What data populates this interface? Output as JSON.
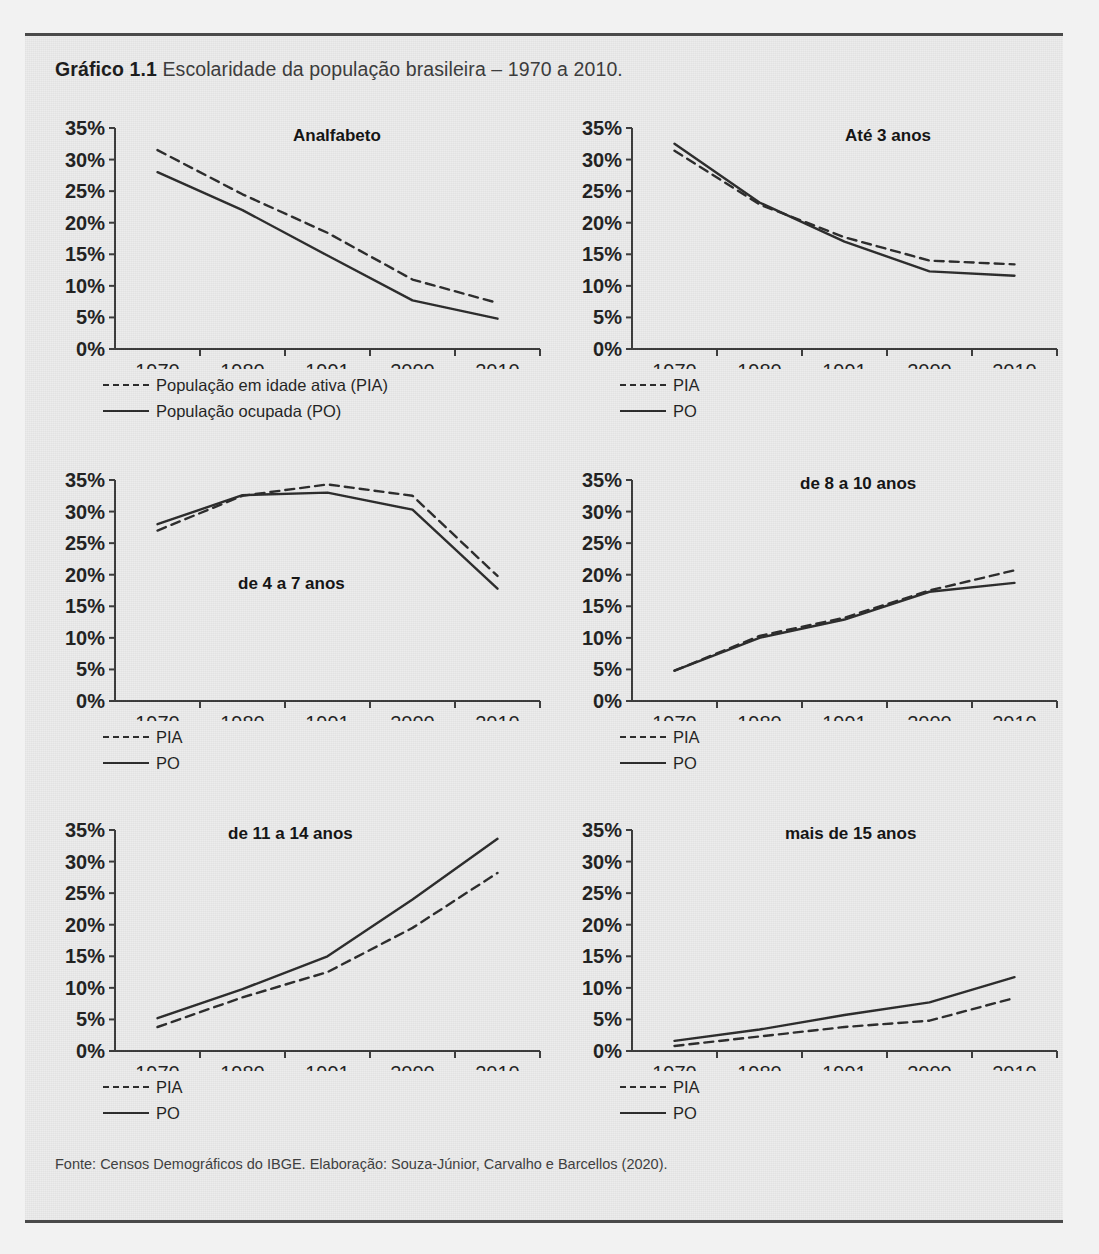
{
  "caption": {
    "strong": "Gráfico 1.1",
    "rest": "Escolaridade da população brasileira – 1970 a 2010."
  },
  "source_note": "Fonte: Censos Demográficos do IBGE. Elaboração: Souza-Júnior, Carvalho e Barcellos (2020).",
  "axis": {
    "y_ticks": [
      "0%",
      "5%",
      "10%",
      "15%",
      "20%",
      "25%",
      "30%",
      "35%"
    ],
    "x_ticks": [
      "1970",
      "1980",
      "1991",
      "2000",
      "2010"
    ],
    "ylim": [
      0,
      35
    ]
  },
  "legend_full": {
    "pia": "População em idade ativa (PIA)",
    "po": "População ocupada (PO)"
  },
  "legend_short": {
    "pia": "PIA",
    "po": "PO"
  },
  "colors": {
    "line": "#2a2a2a",
    "axis": "#3a3a3a",
    "panel_bg": "#ececec",
    "frame_rule": "#4a4a4a",
    "text": "#1f1f1f"
  },
  "chart_data": [
    {
      "type": "line",
      "title": "Analfabeto",
      "xlabel": "",
      "ylabel": "",
      "x": [
        "1970",
        "1980",
        "1991",
        "2000",
        "2010"
      ],
      "ylim": [
        0,
        35
      ],
      "yticks": [
        0,
        5,
        10,
        15,
        20,
        25,
        30,
        35
      ],
      "grid": false,
      "legend_position": "below-left",
      "series": [
        {
          "name": "População em idade ativa (PIA)",
          "style": "dashed",
          "values": [
            31.5,
            24.5,
            18.4,
            11.0,
            7.3
          ]
        },
        {
          "name": "População ocupada (PO)",
          "style": "solid",
          "values": [
            28.0,
            22.0,
            14.8,
            7.7,
            4.8
          ]
        }
      ]
    },
    {
      "type": "line",
      "title": "Até 3 anos",
      "xlabel": "",
      "ylabel": "",
      "x": [
        "1970",
        "1980",
        "1991",
        "2000",
        "2010"
      ],
      "ylim": [
        0,
        35
      ],
      "yticks": [
        0,
        5,
        10,
        15,
        20,
        25,
        30,
        35
      ],
      "grid": false,
      "legend_position": "below-left",
      "series": [
        {
          "name": "PIA",
          "style": "dashed",
          "values": [
            31.4,
            22.9,
            17.7,
            14.0,
            13.4
          ]
        },
        {
          "name": "PO",
          "style": "solid",
          "values": [
            32.5,
            23.2,
            17.0,
            12.3,
            11.6
          ]
        }
      ]
    },
    {
      "type": "line",
      "title": "de 4 a 7 anos",
      "xlabel": "",
      "ylabel": "",
      "x": [
        "1970",
        "1980",
        "1991",
        "2000",
        "2010"
      ],
      "ylim": [
        0,
        35
      ],
      "yticks": [
        0,
        5,
        10,
        15,
        20,
        25,
        30,
        35
      ],
      "grid": false,
      "legend_position": "below-left",
      "series": [
        {
          "name": "PIA",
          "style": "dashed",
          "values": [
            27.0,
            32.5,
            34.3,
            32.5,
            19.8
          ]
        },
        {
          "name": "PO",
          "style": "solid",
          "values": [
            28.0,
            32.6,
            33.0,
            30.3,
            17.8
          ]
        }
      ]
    },
    {
      "type": "line",
      "title": "de 8 a 10 anos",
      "xlabel": "",
      "ylabel": "",
      "x": [
        "1970",
        "1980",
        "1991",
        "2000",
        "2010"
      ],
      "ylim": [
        0,
        35
      ],
      "yticks": [
        0,
        5,
        10,
        15,
        20,
        25,
        30,
        35
      ],
      "grid": false,
      "legend_position": "below-left",
      "series": [
        {
          "name": "PIA",
          "style": "dashed",
          "values": [
            4.8,
            10.3,
            13.2,
            17.5,
            20.7
          ]
        },
        {
          "name": "PO",
          "style": "solid",
          "values": [
            4.8,
            10.0,
            12.9,
            17.3,
            18.7
          ]
        }
      ]
    },
    {
      "type": "line",
      "title": "de 11 a 14 anos",
      "xlabel": "",
      "ylabel": "",
      "x": [
        "1970",
        "1980",
        "1991",
        "2000",
        "2010"
      ],
      "ylim": [
        0,
        35
      ],
      "yticks": [
        0,
        5,
        10,
        15,
        20,
        25,
        30,
        35
      ],
      "grid": false,
      "legend_position": "below-left",
      "series": [
        {
          "name": "PIA",
          "style": "dashed",
          "values": [
            3.8,
            8.5,
            12.5,
            19.5,
            28.2
          ]
        },
        {
          "name": "PO",
          "style": "solid",
          "values": [
            5.2,
            9.8,
            15.0,
            24.0,
            33.6
          ]
        }
      ]
    },
    {
      "type": "line",
      "title": "mais de 15 anos",
      "xlabel": "",
      "ylabel": "",
      "x": [
        "1970",
        "1980",
        "1991",
        "2000",
        "2010"
      ],
      "ylim": [
        0,
        35
      ],
      "yticks": [
        0,
        5,
        10,
        15,
        20,
        25,
        30,
        35
      ],
      "grid": false,
      "legend_position": "below-left",
      "series": [
        {
          "name": "PIA",
          "style": "dashed",
          "values": [
            0.8,
            2.3,
            3.8,
            4.8,
            8.4
          ]
        },
        {
          "name": "PO",
          "style": "solid",
          "values": [
            1.6,
            3.4,
            5.7,
            7.7,
            11.7
          ]
        }
      ]
    }
  ]
}
